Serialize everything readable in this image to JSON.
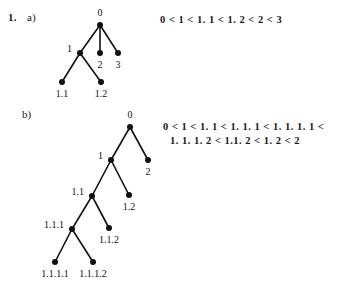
{
  "exercise": {
    "number": "1.",
    "part_a_label": "a)",
    "part_b_label": "b)"
  },
  "formulas": {
    "a": "0 < 1 < 1. 1 < 1. 2 < 2 < 3",
    "b_line1": "0 < 1 < 1. 1 < 1. 1. 1 < 1. 1. 1. 1 <",
    "b_line2": "1. 1. 1. 2 < 1.1. 2 < 1. 2 < 2"
  },
  "colors": {
    "ink": "#111111",
    "paper": "#ffffff"
  },
  "chart_data": {
    "type": "diagram",
    "diagram_kind": "ordered-tree",
    "trees": [
      {
        "id": "tree-a",
        "label": "a)",
        "viewbox": "0 0 360 297",
        "nodes": [
          {
            "id": "0",
            "label": "0",
            "x": 100,
            "y": 25,
            "label_x": 100,
            "label_y": 16,
            "label_anchor": "middle"
          },
          {
            "id": "1",
            "label": "1",
            "x": 80,
            "y": 53,
            "label_x": 72,
            "label_y": 52,
            "label_anchor": "end"
          },
          {
            "id": "2",
            "label": "2",
            "x": 100,
            "y": 53,
            "label_x": 100,
            "label_y": 68,
            "label_anchor": "middle"
          },
          {
            "id": "3",
            "label": "3",
            "x": 118,
            "y": 53,
            "label_x": 118,
            "label_y": 68,
            "label_anchor": "middle"
          },
          {
            "id": "1.1",
            "label": "1.1",
            "x": 62,
            "y": 82,
            "label_x": 62,
            "label_y": 97,
            "label_anchor": "middle"
          },
          {
            "id": "1.2",
            "label": "1.2",
            "x": 101,
            "y": 82,
            "label_x": 101,
            "label_y": 97,
            "label_anchor": "middle"
          }
        ],
        "edges": [
          [
            "0",
            "1"
          ],
          [
            "0",
            "2"
          ],
          [
            "0",
            "3"
          ],
          [
            "1",
            "1.1"
          ],
          [
            "1",
            "1.2"
          ]
        ]
      },
      {
        "id": "tree-b",
        "label": "b)",
        "viewbox": "0 0 360 297",
        "nodes": [
          {
            "id": "0",
            "label": "0",
            "x": 130,
            "y": 127,
            "label_x": 130,
            "label_y": 118,
            "label_anchor": "middle"
          },
          {
            "id": "1",
            "label": "1",
            "x": 111,
            "y": 160,
            "label_x": 103,
            "label_y": 159,
            "label_anchor": "end"
          },
          {
            "id": "2",
            "label": "2",
            "x": 148,
            "y": 160,
            "label_x": 148,
            "label_y": 175,
            "label_anchor": "middle"
          },
          {
            "id": "1.1",
            "label": "1.1",
            "x": 92,
            "y": 196,
            "label_x": 84,
            "label_y": 195,
            "label_anchor": "end"
          },
          {
            "id": "1.2",
            "label": "1.2",
            "x": 129,
            "y": 195,
            "label_x": 129,
            "label_y": 210,
            "label_anchor": "middle"
          },
          {
            "id": "1.1.1",
            "label": "1.1.1",
            "x": 72,
            "y": 229,
            "label_x": 64,
            "label_y": 228,
            "label_anchor": "end"
          },
          {
            "id": "1.1.2",
            "label": "1.1.2",
            "x": 109,
            "y": 228,
            "label_x": 109,
            "label_y": 243,
            "label_anchor": "middle"
          },
          {
            "id": "1.1.1.1",
            "label": "1.1.1.1",
            "x": 55,
            "y": 262,
            "label_x": 55,
            "label_y": 277,
            "label_anchor": "middle"
          },
          {
            "id": "1.1.1.2",
            "label": "1.1.1.2",
            "x": 93,
            "y": 262,
            "label_x": 93,
            "label_y": 277,
            "label_anchor": "middle"
          }
        ],
        "edges": [
          [
            "0",
            "1"
          ],
          [
            "0",
            "2"
          ],
          [
            "1",
            "1.1"
          ],
          [
            "1",
            "1.2"
          ],
          [
            "1.1",
            "1.1.1"
          ],
          [
            "1.1",
            "1.1.2"
          ],
          [
            "1.1.1",
            "1.1.1.1"
          ],
          [
            "1.1.1",
            "1.1.1.2"
          ]
        ]
      }
    ],
    "orderings": {
      "a": "0 < 1 < 1. 1 < 1. 2 < 2 < 3",
      "b": "0 < 1 < 1. 1 < 1. 1. 1 < 1. 1. 1. 1 < 1. 1. 1. 2 < 1.1. 2 < 1. 2 < 2"
    }
  }
}
